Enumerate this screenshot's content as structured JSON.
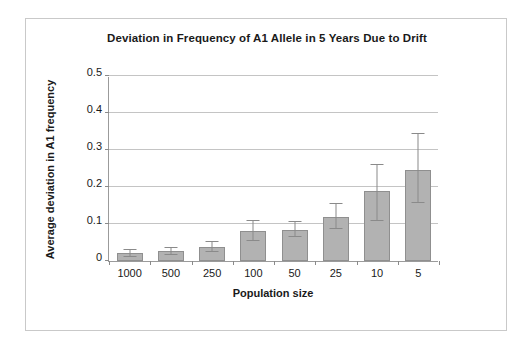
{
  "chart_data": {
    "type": "bar",
    "title": "Deviation in Frequency of A1 Allele in 5 Years Due to Drift",
    "xlabel": "Population size",
    "ylabel": "Average deviation in A1 frequency",
    "categories": [
      "1000",
      "500",
      "250",
      "100",
      "50",
      "25",
      "10",
      "5"
    ],
    "values": [
      0.021,
      0.026,
      0.037,
      0.08,
      0.085,
      0.12,
      0.19,
      0.245
    ],
    "error_upper": [
      0.031,
      0.036,
      0.051,
      0.107,
      0.105,
      0.155,
      0.26,
      0.342
    ],
    "error_lower": [
      0.012,
      0.017,
      0.024,
      0.054,
      0.064,
      0.086,
      0.107,
      0.158
    ],
    "ylim": [
      0,
      0.5
    ],
    "yticks": [
      "0",
      "0.1",
      "0.2",
      "0.3",
      "0.4",
      "0.5"
    ],
    "ytick_values": [
      0,
      0.1,
      0.2,
      0.3,
      0.4,
      0.5
    ],
    "grid": true,
    "legend": false,
    "bar_color": "#b2b2b2",
    "bar_border_color": "#8f8f8f",
    "grid_color": "#c4c4c4",
    "axis_color": "#9b9b9b",
    "frame_color": "#c9c9c9",
    "background": "#ffffff"
  }
}
